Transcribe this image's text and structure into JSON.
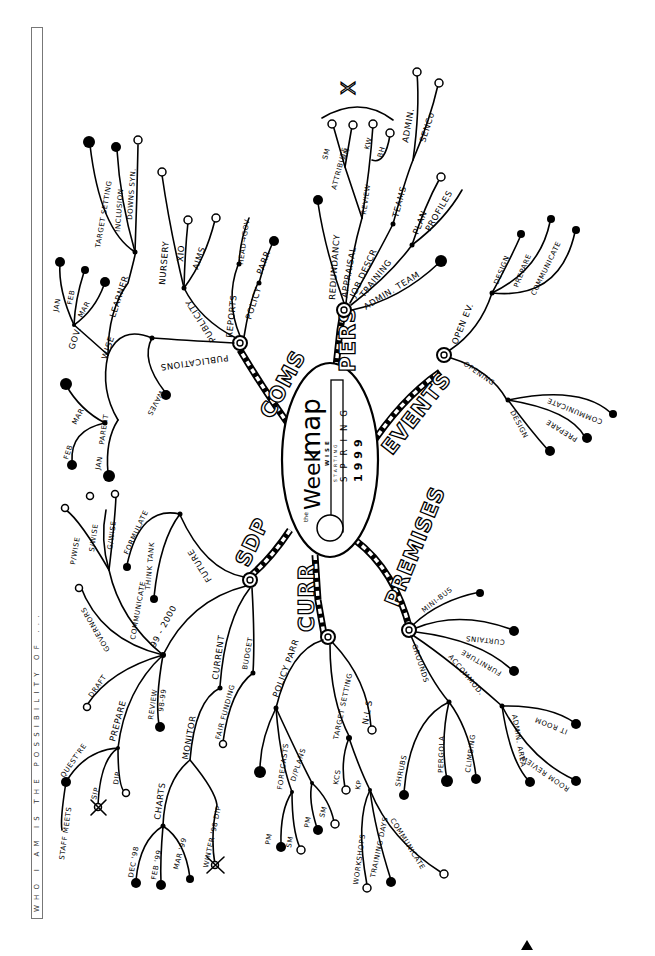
{
  "side_caption": "WHO I AM IS THE POSSIBILITY OF ...",
  "center": {
    "title_small": "the",
    "title_main": "Week",
    "title_suffix": "map",
    "wise_label": "WISE",
    "starting": "STARTING",
    "season": "SPRING",
    "year": "1999"
  },
  "branches": {
    "pers": {
      "label": "PERS",
      "children": {
        "redundancy": "REDUNDANCY",
        "appraisal": "APPRAISAL",
        "appraisal_sub": "ATTRIBUTE",
        "review": "REVIEW",
        "sm": "SM",
        "am": "AM",
        "kw": "KW",
        "bh": "BH",
        "x_mark": "X",
        "job_descr": "JOB DESCR",
        "teams": "TEAMS",
        "admin": "ADMIN.",
        "senco": "SENCo",
        "training": "TRAINING",
        "plan": "PLAN",
        "profiles": "PROFILES",
        "admin_team": "ADMIN. TEAM"
      }
    },
    "coms": {
      "label": "COMS",
      "children": {
        "publications": "PUBLICATIONS",
        "waves": "WAVES",
        "publicity": "PUBLICITY",
        "nursery": "NURSERY",
        "xio": "XIO",
        "aims": "AIMS",
        "reports": "REPORTS",
        "head_gov": "HEAD→GOV",
        "policy": "POLICY",
        "parr": "PARR",
        "wise": "WISE",
        "learner": "LEARNER",
        "target_setting": "TARGET SETTING",
        "inclusion": "INCLUSION",
        "downs_syn": "DOWNS SYN.",
        "gov": "GOV.",
        "jan": "JAN",
        "feb": "FEB",
        "mar": "MAR",
        "parent": "PARENT",
        "parent_jan": "JAN",
        "parent_feb": "FEB",
        "parent_mar": "MAR"
      }
    },
    "events": {
      "label": "EVENTS",
      "children": {
        "open_ev": "OPEN EV.",
        "open_design": "DESIGN",
        "open_prepare": "PREPARE",
        "open_communicate": "COMMUNICATE",
        "opening": "OPENING",
        "opening_design": "DESIGN",
        "opening_prepare": "PREPARE",
        "opening_communicate": "COMMUNICATE"
      }
    },
    "sdp": {
      "label": "SDP",
      "children": {
        "future": "FUTURE",
        "formulate": "FORMULATE",
        "think_tank": "THINK TANK",
        "communicate": "COMMUNICATE",
        "p_wise": "P/WISE",
        "s_wise": "S/WISE",
        "g_wise": "G/WISE",
        "y99_2000": "99 - 2000",
        "governors": "GOVERNORS",
        "draft": "DRAFT",
        "prepare": "PREPARE",
        "questre": "QUEST'RE",
        "staff_meets": "STAFF MEETS",
        "sip": "SIP",
        "dip": "DIP",
        "review": "REVIEW",
        "review_years": "98-99",
        "current": "CURRENT",
        "monitor": "MONITOR",
        "charts": "CHARTS",
        "dec98": "DEC '98",
        "feb99": "FEB '99",
        "mar99": "MAR '99",
        "winter_dip": "WINTER '98 DIP",
        "budget": "BUDGET",
        "fair_funding": "FAIR FUNDING"
      }
    },
    "curr": {
      "label": "CURR",
      "children": {
        "policy_parr": "POLICY PARR",
        "forecasts": "FORECASTS",
        "fc_pm": "PM",
        "fc_sm": "SM",
        "d_plans": "D/PLANS",
        "dp_pm": "PM",
        "dp_sm": "SM",
        "target_setting": "TARGET SETTING",
        "kcs": "KCS",
        "kp": "KP",
        "workshops": "WORKSHOPS",
        "training_days": "TRAINING DAYS",
        "communicate": "COMMUNICATE",
        "nls": "N·L·S"
      }
    },
    "premises": {
      "label": "PREMISES",
      "children": {
        "mini_bus": "MINI-BUS",
        "curtains": "CURTAINS",
        "furniture": "FURNITURE",
        "accommod": "ACCOMMOD.",
        "it_room": "IT ROOM",
        "room_review": "ROOM REVIEW",
        "admin_area": "ADMIN. AREA",
        "grounds": "GROUNDS",
        "shrubs": "SHRUBS",
        "pergola": "PERGOLA",
        "climbing": "CLIMBING"
      }
    }
  },
  "colors": {
    "ink": "#000000",
    "paper": "#ffffff",
    "frame": "#777777"
  }
}
